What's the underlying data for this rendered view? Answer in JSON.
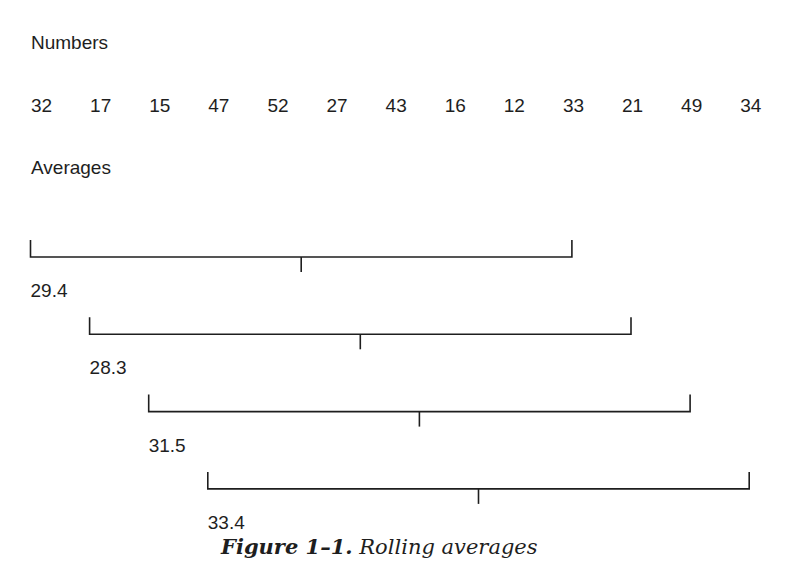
{
  "headings": {
    "numbers": "Numbers",
    "averages": "Averages"
  },
  "numbers": [
    "32",
    "17",
    "15",
    "47",
    "52",
    "27",
    "43",
    "16",
    "12",
    "33",
    "21",
    "49",
    "34"
  ],
  "windows": [
    {
      "start_index": 0,
      "end_index": 9,
      "average": "29.4"
    },
    {
      "start_index": 1,
      "end_index": 10,
      "average": "28.3"
    },
    {
      "start_index": 2,
      "end_index": 11,
      "average": "31.5"
    },
    {
      "start_index": 3,
      "end_index": 12,
      "average": "33.4"
    }
  ],
  "caption": {
    "figure_label": "Figure 1–1.",
    "title": "Rolling averages"
  },
  "colors": {
    "ink": "#1e1e1e",
    "background": "#ffffff"
  }
}
